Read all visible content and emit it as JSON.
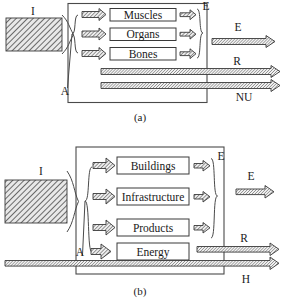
{
  "figure": {
    "title_a_caption": "(a)",
    "title_b_caption": "(b)",
    "symbols": {
      "input": "I",
      "allocation": "A",
      "exergy_internal": "E",
      "exergy_output": "E",
      "residuals": "R",
      "non_utilized": "NU",
      "heat": "H"
    }
  },
  "panel_a": {
    "caption": "(a)",
    "input_label": "I",
    "allocation_label": "A",
    "internal_exergy_label": "E",
    "output_exergy_label": "E",
    "residual_label": "R",
    "non_utilized_label": "NU",
    "boxes": [
      {
        "label": "Muscles"
      },
      {
        "label": "Organs"
      },
      {
        "label": "Bones"
      }
    ]
  },
  "panel_b": {
    "caption": "(b)",
    "input_label": "I",
    "allocation_label": "A",
    "internal_exergy_label": "E",
    "output_exergy_label": "E",
    "residual_label": "R",
    "heat_label": "H",
    "boxes": [
      {
        "label": "Buildings"
      },
      {
        "label": "Infrastructure"
      },
      {
        "label": "Products"
      },
      {
        "label": "Energy"
      }
    ]
  },
  "colors": {
    "stroke": "#3a3a3a",
    "frame": "#4a4a4a",
    "background": "#ffffff",
    "text": "#1a1a1a"
  }
}
